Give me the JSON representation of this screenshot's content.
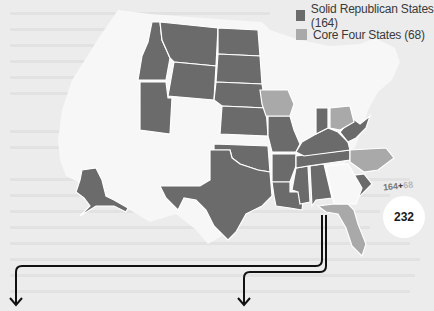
{
  "legend": {
    "items": [
      {
        "label": "Solid Republican States (164)",
        "color": "#6b6b6b"
      },
      {
        "label": "Core Four States (68)",
        "color": "#a9a9a9"
      }
    ]
  },
  "total": {
    "addend_a": "164",
    "plus": "+",
    "addend_b": "68",
    "sum": "232"
  },
  "colors": {
    "background": "#ececec",
    "solid_republican": "#6b6b6b",
    "core_four": "#a9a9a9",
    "other_states": "#f7f7f7",
    "borders": "#ffffff",
    "arrows": "#111111"
  },
  "map": {
    "solid_republican_states": [
      "Alaska",
      "Idaho",
      "Montana",
      "Wyoming",
      "Utah",
      "North Dakota",
      "South Dakota",
      "Nebraska",
      "Kansas",
      "Oklahoma",
      "Texas",
      "Missouri",
      "Arkansas",
      "Louisiana",
      "Mississippi",
      "Alabama",
      "Tennessee",
      "Kentucky",
      "Indiana",
      "West Virginia",
      "South Carolina"
    ],
    "core_four_states": [
      "Iowa",
      "Ohio",
      "North Carolina",
      "Florida"
    ]
  }
}
